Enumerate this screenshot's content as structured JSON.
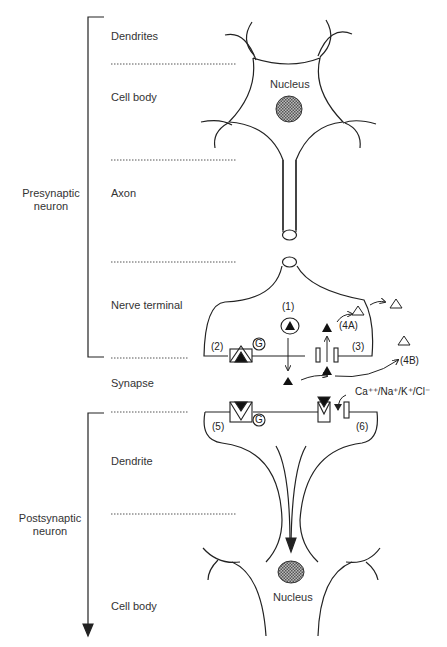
{
  "side_labels": {
    "presynaptic": [
      "Presynaptic",
      "neuron"
    ],
    "postsynaptic": [
      "Postsynaptic",
      "neuron"
    ]
  },
  "region_labels": [
    {
      "text": "Dendrites"
    },
    {
      "text": "Cell body"
    },
    {
      "text": "Axon"
    },
    {
      "text": "Nerve terminal"
    },
    {
      "text": "Synapse"
    },
    {
      "text": "Dendrite"
    },
    {
      "text": "Cell body"
    }
  ],
  "nucleus_labels": {
    "top": "Nucleus",
    "bottom": "Nucleus"
  },
  "step_labels": {
    "s1": "(1)",
    "s2": "(2)",
    "s3": "(3)",
    "s4a": "(4A)",
    "s4b": "(4B)",
    "s5": "(5)",
    "s6": "(6)"
  },
  "g_protein_label": "G",
  "ion_label": "Ca⁺⁺/Na⁺/K⁺/Cl⁻",
  "colors": {
    "line": "#222222",
    "dotted": "#555555",
    "nucleus_fill": "#777777"
  }
}
